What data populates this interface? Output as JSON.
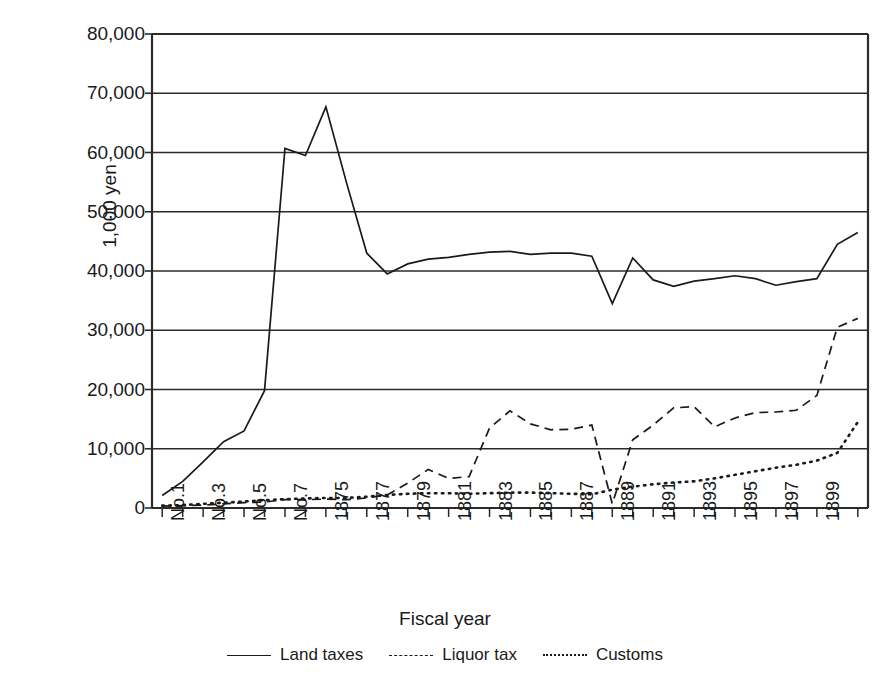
{
  "chart_data": {
    "type": "line",
    "title": "",
    "xlabel": "Fiscal year",
    "ylabel": "1,000 yen",
    "ylim": [
      0,
      80000
    ],
    "ytick_values": [
      0,
      10000,
      20000,
      30000,
      40000,
      50000,
      60000,
      70000,
      80000
    ],
    "ytick_labels": [
      "0",
      "10,000",
      "20,000",
      "30,000",
      "40,000",
      "50,000",
      "60,000",
      "70,000",
      "80,000"
    ],
    "grid": true,
    "grid_axis": "y",
    "legend_position": "bottom",
    "x": [
      "No.1",
      "No.2",
      "No.3",
      "No.4",
      "No.5",
      "No.6",
      "No.7",
      "1874",
      "1875",
      "1876",
      "1877",
      "1878",
      "1879",
      "1880",
      "1881",
      "1882",
      "1883",
      "1884",
      "1885",
      "1886",
      "1887",
      "1888",
      "1889",
      "1890",
      "1891",
      "1892",
      "1893",
      "1894",
      "1895",
      "1896",
      "1897",
      "1898",
      "1899",
      "1900",
      "1901"
    ],
    "xtick_labels_shown": [
      "No.1",
      "",
      "No.3",
      "",
      "No.5",
      "",
      "No.7",
      "",
      "1875",
      "",
      "1877",
      "",
      "1879",
      "",
      "1881",
      "",
      "1883",
      "",
      "1885",
      "",
      "1887",
      "",
      "1889",
      "",
      "1891",
      "",
      "1893",
      "",
      "1895",
      "",
      "1897",
      "",
      "1899",
      "",
      ""
    ],
    "series": [
      {
        "name": "Land taxes",
        "style": "solid",
        "color": "#1a1a1a",
        "values": [
          2100,
          4500,
          7800,
          11200,
          13000,
          19800,
          60700,
          59500,
          67700,
          55000,
          43000,
          39500,
          41200,
          42000,
          42300,
          42800,
          43200,
          43300,
          42800,
          43000,
          43000,
          42500,
          34500,
          42200,
          38500,
          37400,
          38300,
          38700,
          39200,
          38700,
          37600,
          38200,
          38700,
          44500,
          46500
        ]
      },
      {
        "name": "Liquor tax",
        "style": "dashed",
        "color": "#1a1a1a",
        "values": [
          300,
          400,
          500,
          700,
          900,
          1000,
          1400,
          1400,
          1500,
          1400,
          1700,
          2200,
          4200,
          6500,
          5000,
          5300,
          13500,
          16400,
          14200,
          13200,
          13300,
          14000,
          700,
          11500,
          14000,
          16900,
          17100,
          13700,
          15200,
          16100,
          16200,
          16500,
          19000,
          30500,
          32000
        ]
      },
      {
        "name": "Customs",
        "style": "dotted",
        "color": "#1a1a1a",
        "values": [
          400,
          500,
          700,
          900,
          1100,
          1300,
          1500,
          1600,
          1700,
          1700,
          1900,
          2200,
          2400,
          2500,
          2500,
          2400,
          2500,
          2600,
          2600,
          2500,
          2400,
          2300,
          3100,
          3600,
          4000,
          4300,
          4500,
          5000,
          5600,
          6200,
          6800,
          7300,
          8000,
          9300,
          14500
        ]
      }
    ],
    "series_extra_note": {
      "liquor_tax_tail": [
        50000,
        50000
      ],
      "customs_tail": [
        16400,
        17000
      ]
    },
    "plot_area": {
      "left": 152,
      "top": 34,
      "right": 868,
      "bottom": 508
    }
  },
  "legend": {
    "items": [
      {
        "label": "Land taxes",
        "style": "solid"
      },
      {
        "label": "Liquor tax",
        "style": "dashed"
      },
      {
        "label": "Customs",
        "style": "dotted"
      }
    ]
  }
}
